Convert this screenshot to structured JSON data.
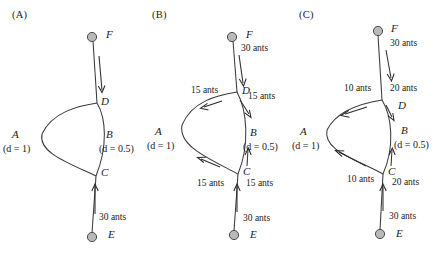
{
  "figure": {
    "caption_absent": true,
    "panels": [
      {
        "id": "A",
        "label": "(A)",
        "nodes": {
          "F": "F",
          "D": "D",
          "A": "A",
          "B": "B",
          "C": "C",
          "E": "E"
        },
        "diffusion": {
          "A": "(d = 1)",
          "B": "(d = 0.5)"
        },
        "flows": [
          {
            "name": "E-to-C",
            "text": "30 ants"
          }
        ]
      },
      {
        "id": "B",
        "label": "(B)",
        "nodes": {
          "F": "F",
          "D": "D",
          "A": "A",
          "B": "B",
          "C": "C",
          "E": "E"
        },
        "diffusion": {
          "A": "(d = 1)",
          "B": "(d = 0.5)"
        },
        "flows": [
          {
            "name": "F-to-D",
            "text": "30 ants"
          },
          {
            "name": "D-to-A",
            "text": "15 ants"
          },
          {
            "name": "D-to-B",
            "text": "15 ants"
          },
          {
            "name": "C-to-A",
            "text": "15 ants"
          },
          {
            "name": "C-to-B",
            "text": "15 ants"
          },
          {
            "name": "E-to-C",
            "text": "30 ants"
          }
        ]
      },
      {
        "id": "C",
        "label": "(C)",
        "nodes": {
          "F": "F",
          "D": "D",
          "A": "A",
          "B": "B",
          "C": "C",
          "E": "E"
        },
        "diffusion": {
          "A": "(d = 1)",
          "B": "(d = 0.5)"
        },
        "flows": [
          {
            "name": "F-to-D",
            "text": "30 ants"
          },
          {
            "name": "D-to-B",
            "text": "20 ants"
          },
          {
            "name": "D-to-A",
            "text": "10 ants"
          },
          {
            "name": "C-to-A",
            "text": "10 ants"
          },
          {
            "name": "C-to-B",
            "text": "20 ants"
          },
          {
            "name": "E-to-C",
            "text": "30 ants"
          }
        ]
      }
    ]
  }
}
